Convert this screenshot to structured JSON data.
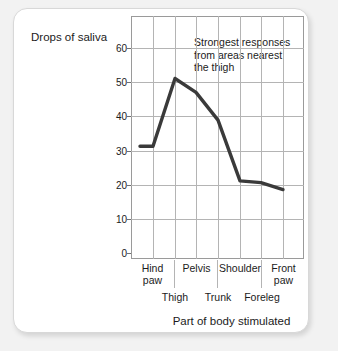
{
  "chart_data": {
    "type": "line",
    "title": "",
    "ylabel": "Drops of saliva",
    "xlabel": "Part of body stimulated",
    "ylim": [
      0,
      70
    ],
    "yticks": [
      0,
      10,
      20,
      30,
      40,
      50,
      60
    ],
    "grid": true,
    "legend": "none",
    "categories": [
      "Hind paw",
      "Thigh",
      "Pelvis",
      "Trunk",
      "Shoulder",
      "Foreleg",
      "Front paw"
    ],
    "values": [
      32.5,
      52,
      48,
      40,
      22.5,
      22,
      20
    ],
    "series": [
      {
        "name": "Drops of saliva",
        "color": "#3a3a3a",
        "values": [
          32.5,
          52,
          48,
          40,
          22.5,
          22,
          20
        ]
      }
    ],
    "annotations": [
      {
        "text": "Strongest responses from areas nearest the thigh",
        "lines": [
          "Strongest responses",
          "from areas nearest",
          "the thigh"
        ]
      }
    ],
    "x_axis_rows": {
      "upper": [
        "Hind paw",
        "Pelvis",
        "Shoulder",
        "Front paw"
      ],
      "lower": [
        "Thigh",
        "Trunk",
        "Foreleg"
      ]
    }
  },
  "axis": {
    "y_title": "Drops of saliva",
    "x_title": "Part of body stimulated",
    "y_ticks": [
      {
        "label": "60",
        "value": 60
      },
      {
        "label": "50",
        "value": 50
      },
      {
        "label": "40",
        "value": 40
      },
      {
        "label": "30",
        "value": 30
      },
      {
        "label": "20",
        "value": 20
      },
      {
        "label": "10",
        "value": 10
      },
      {
        "label": "0",
        "value": 0
      }
    ]
  },
  "annotation": {
    "line1": "Strongest responses",
    "line2": "from areas nearest",
    "line3": "the thigh"
  },
  "x_labels_upper": [
    {
      "line1": "Hind",
      "line2": "paw"
    },
    {
      "line1": "Pelvis",
      "line2": ""
    },
    {
      "line1": "Shoulder",
      "line2": ""
    },
    {
      "line1": "Front",
      "line2": "paw"
    }
  ],
  "x_labels_lower": [
    {
      "label": "Thigh"
    },
    {
      "label": "Trunk"
    },
    {
      "label": "Foreleg"
    }
  ],
  "colors": {
    "line": "#3a3a3a",
    "grid": "#b4b4b4",
    "frame": "#9a9a9a",
    "text": "#1b1b1b",
    "card": "#ffffff",
    "page": "#f2f2f2"
  }
}
